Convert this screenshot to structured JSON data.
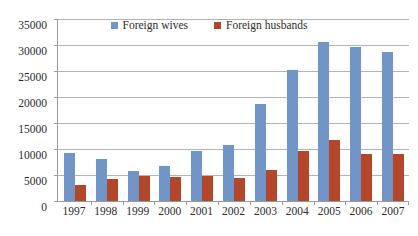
{
  "chart_data": {
    "type": "bar",
    "title": "",
    "subtitle": "",
    "xlabel": "",
    "ylabel": "",
    "categories": [
      "1997",
      "1998",
      "1999",
      "2000",
      "2001",
      "2002",
      "2003",
      "2004",
      "2005",
      "2006",
      "2007"
    ],
    "series": [
      {
        "name": "Foreign wives",
        "color": "#7295c8",
        "values": [
          9200,
          8000,
          5700,
          6800,
          9700,
          10700,
          18700,
          25100,
          30600,
          29700,
          28600
        ]
      },
      {
        "name": "Foreign husbands",
        "color": "#b4472a",
        "values": [
          3100,
          4200,
          4900,
          4700,
          4900,
          4500,
          6000,
          9600,
          11700,
          9100,
          9000
        ]
      }
    ],
    "ylim": [
      0,
      35000
    ],
    "yticks": [
      0,
      5000,
      10000,
      15000,
      20000,
      25000,
      30000,
      35000
    ],
    "ytick_labels": [
      "0",
      "5000",
      "10000",
      "15000",
      "20000",
      "25000",
      "30000",
      "35000"
    ],
    "grid": true,
    "legend_position": "top-center"
  },
  "legend": {
    "entries": [
      {
        "label": "Foreign wives",
        "color": "#7295c8"
      },
      {
        "label": "Foreign husbands",
        "color": "#b4472a"
      }
    ]
  },
  "colors": {
    "wives": "#7295c8",
    "husbands": "#b4472a",
    "gridline": "#b3b3b3",
    "axis": "#9a9a9a",
    "text": "#2b2b2b",
    "background": "#ffffff"
  }
}
